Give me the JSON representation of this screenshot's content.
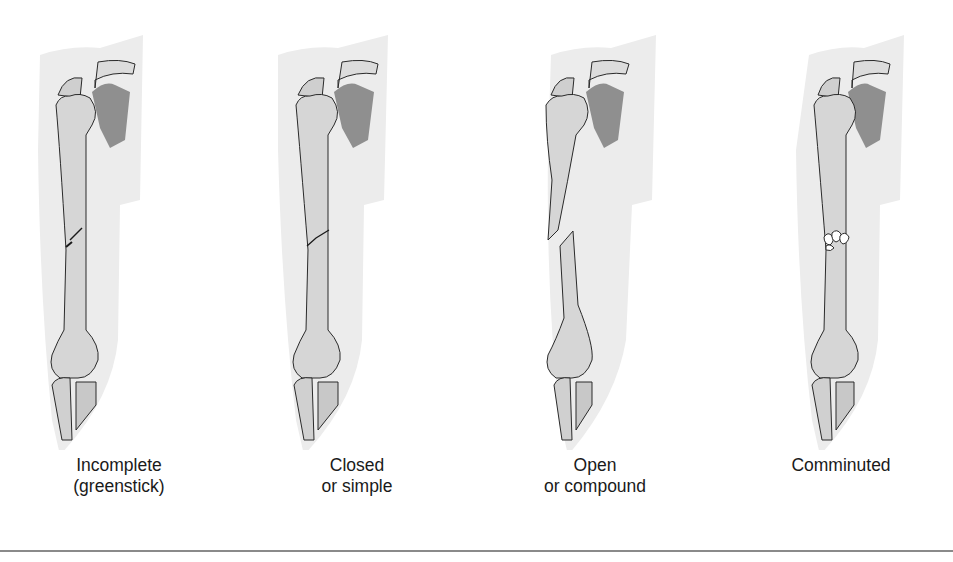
{
  "figure": {
    "panels": [
      {
        "id": "incomplete",
        "label_line1": "Incomplete",
        "label_line2": "(greenstick)",
        "fracture": "partial crack"
      },
      {
        "id": "closed",
        "label_line1": "Closed",
        "label_line2": "or simple",
        "fracture": "clean oblique break"
      },
      {
        "id": "open",
        "label_line1": "Open",
        "label_line2": "or compound",
        "fracture": "displaced break"
      },
      {
        "id": "comminuted",
        "label_line1": "Comminuted",
        "label_line2": "",
        "fracture": "fragmented break"
      }
    ],
    "colors": {
      "skin_shadow": "#ececec",
      "bone_fill": "#d6d6d6",
      "bone_shade": "#b8b8b8",
      "scapula": "#8f8f8f",
      "outline": "#2a2a2a",
      "rule": "#8a8a8a"
    }
  }
}
